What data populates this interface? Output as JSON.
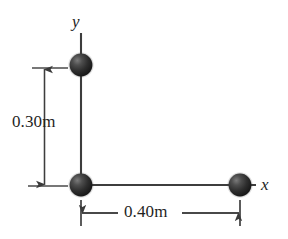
{
  "figure": {
    "type": "physics-diagram",
    "background_color": "#ffffff",
    "line_color": "#3a3a3a",
    "sphere_color": "#2b2b2b"
  },
  "axes": {
    "y_axis_label": "y",
    "x_axis_label": "x",
    "origin_px": {
      "x": 81,
      "y": 185
    }
  },
  "spheres": [
    {
      "name": "sphere-top",
      "cx": 81,
      "cy": 65,
      "r": 11.5
    },
    {
      "name": "sphere-origin",
      "cx": 81,
      "cy": 185,
      "r": 11.5
    },
    {
      "name": "sphere-right",
      "cx": 240,
      "cy": 185,
      "r": 11.5
    }
  ],
  "dimensions": {
    "vertical": {
      "label": "0.30m",
      "value": 0.3,
      "unit": "m",
      "orientation": "vertical"
    },
    "horizontal": {
      "label": "0.40m",
      "value": 0.4,
      "unit": "m",
      "orientation": "horizontal"
    }
  }
}
